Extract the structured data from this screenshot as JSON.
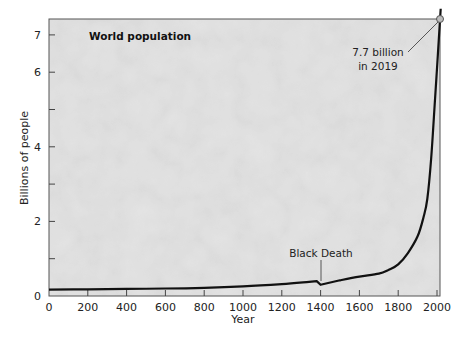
{
  "chart_data": {
    "type": "line",
    "title": "World population",
    "xlabel": "Year",
    "ylabel": "Billions of people",
    "xlim": [
      0,
      2000
    ],
    "ylim": [
      0,
      7
    ],
    "x_ticks": [
      0,
      200,
      400,
      600,
      800,
      1000,
      1200,
      1400,
      1600,
      1800,
      2000
    ],
    "x_tick_labels": [
      "0",
      "200",
      "400",
      "600",
      "800",
      "1000",
      "1200",
      "1400",
      "1600",
      "1800",
      "2000"
    ],
    "y_ticks": [
      0,
      1,
      2,
      3,
      4,
      5,
      6,
      7
    ],
    "y_tick_labels": [
      "0",
      "",
      "2",
      "",
      "4",
      "",
      "6",
      "7"
    ],
    "grid": false,
    "legend": null,
    "background": "grayscale crowd photograph",
    "series": [
      {
        "name": "World population",
        "color": "#111111",
        "x": [
          0,
          200,
          400,
          600,
          800,
          1000,
          1200,
          1340,
          1380,
          1400,
          1500,
          1600,
          1700,
          1750,
          1800,
          1850,
          1900,
          1930,
          1950,
          1970,
          1990,
          2000,
          2019
        ],
        "y": [
          0.17,
          0.18,
          0.19,
          0.2,
          0.22,
          0.26,
          0.32,
          0.38,
          0.4,
          0.3,
          0.42,
          0.52,
          0.6,
          0.7,
          0.85,
          1.15,
          1.6,
          2.1,
          2.6,
          3.7,
          5.3,
          6.1,
          7.7
        ]
      }
    ],
    "annotations": [
      {
        "text": "Black Death",
        "x": 1400,
        "y": 0.35
      },
      {
        "text_line1": "7.7 billion",
        "text_line2": "in 2019",
        "x": 2019,
        "y": 7.7
      }
    ]
  },
  "labels": {
    "title": "World population",
    "xlabel": "Year",
    "ylabel": "Billions of people",
    "black_death": "Black Death",
    "endpoint_line1": "7.7 billion",
    "endpoint_line2": "in 2019"
  }
}
